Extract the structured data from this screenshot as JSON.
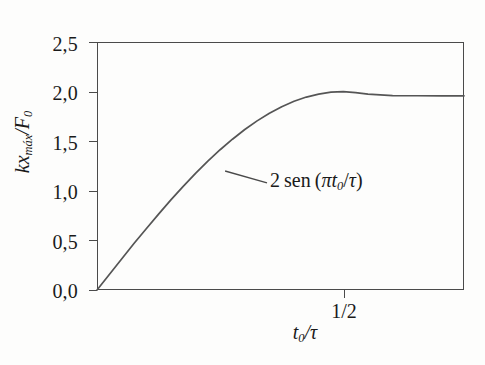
{
  "figure": {
    "background_color": "#fdfdfc",
    "axis_color": "#4a4a4a",
    "curve_color": "#555555"
  },
  "axes": {
    "y_label_parts": {
      "k": "k",
      "x": "x",
      "sub": "máx",
      "slash": "/",
      "F": "F",
      "Fsub": "0"
    },
    "x_label_parts": {
      "t": "t",
      "tsub": "0",
      "slash": "/",
      "tau": "τ"
    },
    "y_ticks": [
      "0,0",
      "0,5",
      "1,0",
      "1,5",
      "2,0",
      "2,5"
    ],
    "y_tick_values": [
      0.0,
      0.5,
      1.0,
      1.5,
      2.0,
      2.5
    ],
    "x_ticks": [
      "1/2"
    ],
    "x_tick_values": [
      0.5
    ]
  },
  "annotation": {
    "coefficient": "2",
    "function": "sen",
    "open_paren": "(",
    "pi": "π",
    "t": "t",
    "t_sub": "0",
    "slash": "/",
    "tau": "τ",
    "close_paren": ")",
    "full_text": "2 sen (πt₀/τ)"
  },
  "chart_data": {
    "type": "line",
    "title": "",
    "xlabel": "t0/tau",
    "ylabel": "kx_max/F0",
    "xlim": [
      0,
      0.745
    ],
    "ylim": [
      0,
      2.5
    ],
    "grid": false,
    "legend": null,
    "series": [
      {
        "name": "2 sen (pi t0/tau)",
        "formula": "y = 2*sin(pi*x) for x <= 0.5, saturating at 2.0 thereafter",
        "x": [
          0.0,
          0.025,
          0.05,
          0.075,
          0.1,
          0.125,
          0.15,
          0.175,
          0.2,
          0.225,
          0.25,
          0.275,
          0.3,
          0.325,
          0.35,
          0.375,
          0.4,
          0.425,
          0.45,
          0.475,
          0.5,
          0.525,
          0.55,
          0.6,
          0.65,
          0.7,
          0.745
        ],
        "y": [
          0.0,
          0.157,
          0.313,
          0.468,
          0.618,
          0.765,
          0.908,
          1.045,
          1.176,
          1.3,
          1.414,
          1.52,
          1.618,
          1.705,
          1.782,
          1.848,
          1.902,
          1.945,
          1.975,
          1.994,
          2.0,
          1.99,
          1.975,
          1.96,
          1.958,
          1.957,
          1.957
        ]
      }
    ],
    "annotations": [
      {
        "text": "2 sen (πt₀/τ)",
        "attach_x": 0.26,
        "attach_y": 1.2,
        "label_x": 0.345,
        "label_y": 1.08
      }
    ]
  }
}
